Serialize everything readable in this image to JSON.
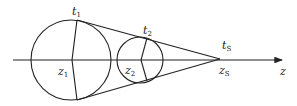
{
  "diagram": {
    "axis": {
      "label": "z",
      "sub": ""
    },
    "circle1": {
      "center_label": "z",
      "center_sub": "1",
      "tangent_label": "t",
      "tangent_sub": "1"
    },
    "circle2": {
      "center_label": "z",
      "center_sub": "2",
      "tangent_label": "t",
      "tangent_sub": "2"
    },
    "apex": {
      "point_label": "z",
      "point_sub": "S",
      "tangent_label": "t",
      "tangent_sub": "S"
    },
    "colors": {
      "stroke": "#222222",
      "background": "#ffffff"
    }
  }
}
